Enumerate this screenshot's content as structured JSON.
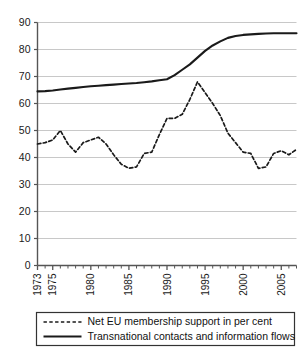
{
  "chart_data": {
    "type": "line",
    "title": "",
    "subtitle": "",
    "xlabel": "",
    "ylabel": "",
    "xlim": [
      1973,
      2007
    ],
    "ylim": [
      0,
      90
    ],
    "grid": true,
    "legend_position": "below-left",
    "y_ticks": [
      0,
      10,
      20,
      30,
      40,
      50,
      60,
      70,
      80,
      90
    ],
    "y_tick_labels": [
      "0",
      "10",
      "20",
      "30",
      "40",
      "50",
      "60",
      "70",
      "80",
      "90"
    ],
    "x_ticks": [
      1973,
      1975,
      1980,
      1985,
      1990,
      1995,
      2000,
      2005
    ],
    "x_tick_labels": [
      "1973",
      "1975",
      "1980",
      "1985",
      "1990",
      "1995",
      "2000",
      "2005"
    ],
    "x_minor_ticks_every": 1,
    "x": [
      1973,
      1974,
      1975,
      1976,
      1977,
      1978,
      1979,
      1980,
      1981,
      1982,
      1983,
      1984,
      1985,
      1986,
      1987,
      1988,
      1989,
      1990,
      1991,
      1992,
      1993,
      1994,
      1995,
      1996,
      1997,
      1998,
      1999,
      2000,
      2001,
      2002,
      2003,
      2004,
      2005,
      2006,
      2007
    ],
    "series": [
      {
        "name": "Net EU membership support in per cent",
        "style": "dashed",
        "color": "#1a1a1a",
        "values": [
          45.0,
          45.5,
          46.5,
          50.0,
          45.0,
          42.0,
          45.5,
          46.5,
          47.5,
          45.0,
          41.0,
          37.5,
          36.0,
          36.5,
          41.5,
          42.0,
          48.5,
          54.5,
          54.5,
          56.0,
          61.5,
          68.0,
          64.0,
          60.0,
          55.5,
          49.0,
          45.5,
          42.0,
          41.5,
          36.0,
          36.5,
          41.5,
          42.5,
          41.0,
          43.0
        ]
      },
      {
        "name": "Transnational contacts and information flows",
        "style": "solid",
        "color": "#1a1a1a",
        "values": [
          64.5,
          64.6,
          64.8,
          65.2,
          65.5,
          65.8,
          66.1,
          66.4,
          66.6,
          66.8,
          67.0,
          67.2,
          67.4,
          67.6,
          67.9,
          68.2,
          68.6,
          69.0,
          70.5,
          72.5,
          74.5,
          77.0,
          79.5,
          81.5,
          83.0,
          84.3,
          85.0,
          85.4,
          85.6,
          85.8,
          85.9,
          86.0,
          86.0,
          86.0,
          86.0
        ]
      }
    ],
    "series_dashed_detail": {
      "name": "Net EU membership support in per cent",
      "x": [
        1973,
        1974,
        1975,
        1976,
        1977,
        1978,
        1979,
        1980,
        1981,
        1982,
        1983,
        1984,
        1985,
        1986,
        1987,
        1988,
        1989,
        1990,
        1991,
        1992,
        1993,
        1994,
        1995,
        1996,
        1997,
        1998,
        1999,
        2000,
        2001,
        2002,
        2003,
        2004,
        2005,
        2006,
        2007
      ],
      "values": [
        45.0,
        45.5,
        46.5,
        50.0,
        45.0,
        42.0,
        45.5,
        46.5,
        47.5,
        45.0,
        41.0,
        37.5,
        36.0,
        36.5,
        41.5,
        42.0,
        48.5,
        54.5,
        54.5,
        56.0,
        61.5,
        68.0,
        64.0,
        60.0,
        55.5,
        49.0,
        45.5,
        42.0,
        41.5,
        36.0,
        36.5,
        41.5,
        42.5,
        41.0,
        43.0
      ]
    },
    "notes": {
      "dashed_peak_year": 1991,
      "dashed_peak_value": 68,
      "dashed_min_value": 36,
      "solid_start_value": 64.5,
      "solid_end_value": 86
    }
  },
  "legend": {
    "items": [
      {
        "label": "Net EU membership support in per cent",
        "style": "dashed"
      },
      {
        "label": "Transnational contacts and information flows",
        "style": "solid"
      }
    ]
  },
  "axes": {
    "y_labels": [
      "90",
      "80",
      "70",
      "60",
      "50",
      "40",
      "30",
      "20",
      "10",
      "0"
    ],
    "x_labels": [
      "1973",
      "1975",
      "1980",
      "1985",
      "1990",
      "1995",
      "2000",
      "2005"
    ]
  },
  "colors": {
    "line": "#1a1a1a",
    "grid": "#c8c8c8",
    "axis": "#555555",
    "background": "#ffffff"
  }
}
